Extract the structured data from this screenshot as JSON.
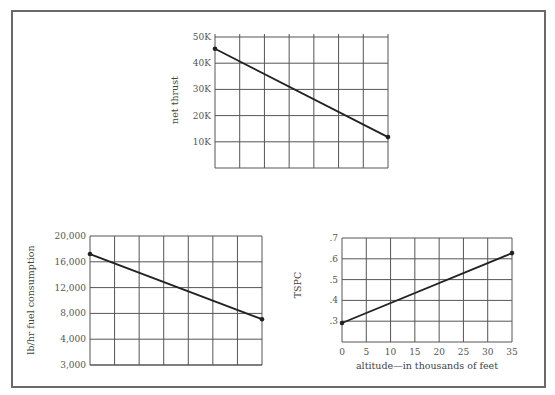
{
  "chart_data": [
    {
      "type": "line",
      "title": "",
      "ylabel": "net thrust",
      "xlabel": "",
      "x": [
        0,
        35
      ],
      "xlim": [
        0,
        35
      ],
      "x_gridlines": 7,
      "y_ticks": [
        50000,
        40000,
        30000,
        20000,
        10000
      ],
      "y_tick_labels": [
        "50K",
        "40K",
        "30K",
        "20K",
        "10K"
      ],
      "ylim": [
        0,
        50000
      ],
      "grid": true,
      "series": [
        {
          "name": "net thrust",
          "values": [
            45500,
            11800
          ]
        }
      ],
      "box": {
        "left": 215,
        "top": 37,
        "right": 388,
        "bottom": 168
      }
    },
    {
      "type": "line",
      "title": "",
      "ylabel": "lb/hr fuel consumption",
      "xlabel": "",
      "x": [
        0,
        35
      ],
      "xlim": [
        0,
        35
      ],
      "x_gridlines": 7,
      "y_ticks": [
        20000,
        16000,
        12000,
        8000,
        4000,
        3000
      ],
      "y_tick_labels": [
        "20,000",
        "16,000",
        "12,000",
        "8,000",
        "4,000",
        "3,000"
      ],
      "grid": true,
      "series": [
        {
          "name": "fuel consumption",
          "values": [
            17200,
            7100
          ]
        }
      ],
      "box": {
        "left": 90,
        "top": 236,
        "right": 262,
        "bottom": 365
      }
    },
    {
      "type": "line",
      "title": "",
      "ylabel": "TSPC",
      "xlabel": "altitude—in thousands of feet",
      "x": [
        0,
        35
      ],
      "xlim": [
        0,
        35
      ],
      "x_ticks": [
        0,
        5,
        10,
        15,
        20,
        25,
        30,
        35
      ],
      "x_tick_labels": [
        "0",
        "5",
        "10",
        "15",
        "20",
        "25",
        "30",
        "35"
      ],
      "y_ticks": [
        0.7,
        0.6,
        0.5,
        0.4,
        0.3
      ],
      "y_tick_labels": [
        ".7",
        ".6",
        ".5",
        ".4",
        ".3"
      ],
      "ylim": [
        0.3,
        0.7
      ],
      "grid": true,
      "series": [
        {
          "name": "TSPC",
          "values": [
            0.373,
            0.642
          ]
        }
      ],
      "box": {
        "left": 342,
        "top": 238,
        "right": 512,
        "bottom": 342
      }
    }
  ],
  "labels": {
    "thrust_ylabel": "net thrust",
    "fuel_ylabel": "lb/hr fuel consumption",
    "tspc_ylabel": "TSPC",
    "tspc_xlabel": "altitude—in thousands of feet"
  },
  "colors": {
    "grid": "#555555",
    "line": "#222222",
    "text": "#555555",
    "frame": "#6a6a6a"
  }
}
